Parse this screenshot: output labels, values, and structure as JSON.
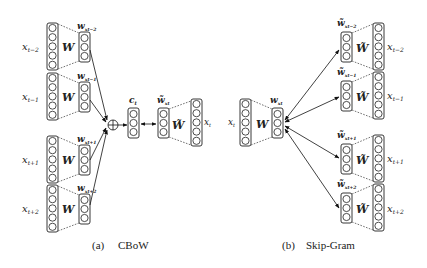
{
  "cbow": {
    "caption_tag": "(a)",
    "caption": "CBoW",
    "inputs": [
      {
        "label": "x",
        "sub": "t−2",
        "vec": "w",
        "vec_sub": "x_{t−2}",
        "matrix": "W"
      },
      {
        "label": "x",
        "sub": "t−1",
        "vec": "w",
        "vec_sub": "x_{t−1}",
        "matrix": "W"
      },
      {
        "label": "x",
        "sub": "t+1",
        "vec": "w",
        "vec_sub": "x_{t+1}",
        "matrix": "W"
      },
      {
        "label": "x",
        "sub": "t+2",
        "vec": "w",
        "vec_sub": "x_{t+2}",
        "matrix": "W"
      }
    ],
    "sum_symbol": "⊕",
    "context": {
      "label": "c",
      "sub": "t"
    },
    "output_vec": {
      "label": "w̃",
      "sub": "x_t"
    },
    "output_matrix": "W̃",
    "output": {
      "label": "x",
      "sub": "t"
    }
  },
  "skipgram": {
    "caption_tag": "(b)",
    "caption": "Skip-Gram",
    "input": {
      "label": "x",
      "sub": "t"
    },
    "input_matrix": "W",
    "center_vec": {
      "label": "w",
      "sub": "x_t"
    },
    "outputs": [
      {
        "vec": "w̃",
        "vec_sub": "x_{t−2}",
        "matrix": "W̃",
        "label": "x",
        "sub": "t−2"
      },
      {
        "vec": "w̃",
        "vec_sub": "x_{t−1}",
        "matrix": "W̃",
        "label": "x",
        "sub": "t−1"
      },
      {
        "vec": "w̃",
        "vec_sub": "x_{t+1}",
        "matrix": "W̃",
        "label": "x",
        "sub": "t+1"
      },
      {
        "vec": "w̃",
        "vec_sub": "x_{t+2}",
        "matrix": "W̃",
        "label": "x",
        "sub": "t+2"
      }
    ]
  },
  "text": {
    "W": "W",
    "Wt": "W̃",
    "x": "x",
    "w": "w",
    "wt": "w̃",
    "c": "c",
    "plus": "⊕",
    "sub_tm2": "t−2",
    "sub_tm1": "t−1",
    "sub_tp1": "t+1",
    "sub_tp2": "t+2",
    "sub_t": "t",
    "vsub_tm2": "xt−2",
    "vsub_tm1": "xt−1",
    "vsub_tp1": "xt+1",
    "vsub_tp2": "xt+2",
    "vsub_t": "xt",
    "cap_a": "(a)",
    "cap_a_name": "CBoW",
    "cap_b": "(b)",
    "cap_b_name": "Skip-Gram"
  }
}
